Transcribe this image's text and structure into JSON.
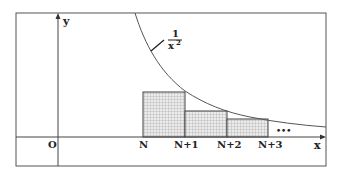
{
  "diagram": {
    "type": "integral-comparison",
    "axes": {
      "x_label": "x",
      "y_label": "y",
      "origin_label": "O"
    },
    "curve": {
      "label_numerator": "1",
      "label_denominator": "x",
      "label_exponent": "2",
      "function": "1/x^2"
    },
    "tick_labels": [
      "N",
      "N+1",
      "N+2",
      "N+3"
    ],
    "ellipsis": "•••",
    "rectangles": [
      {
        "from": "N",
        "to": "N+1",
        "top_y": 92
      },
      {
        "from": "N+1",
        "to": "N+2",
        "top_y": 111
      },
      {
        "from": "N+2",
        "to": "N+3",
        "top_y": 119
      }
    ],
    "colors": {
      "line": "#444444",
      "hatch": "#999999",
      "fill": "#e8e8e8"
    }
  }
}
